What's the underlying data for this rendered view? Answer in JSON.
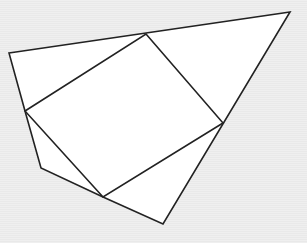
{
  "figure": {
    "outer_shape": {
      "name": "outer-polygon",
      "vertex_count": 5,
      "fill": "#ffffff",
      "stroke": "#222222"
    },
    "inscribed_shape": {
      "name": "inscribed-square",
      "vertex_count": 4,
      "stroke": "#222222"
    },
    "background": "#ededed",
    "labels": []
  }
}
